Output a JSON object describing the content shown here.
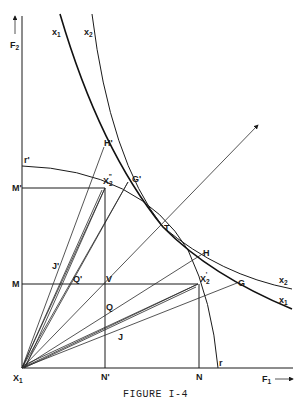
{
  "figure": {
    "caption": "FIGURE I-4",
    "axes": {
      "x_label": "F",
      "x_label_sub": "1",
      "y_label": "F",
      "y_label_sub": "2",
      "origin_label": "X",
      "origin_label_sub": "1"
    },
    "curves": {
      "isoquant_x1": {
        "label": "x",
        "sub": "1"
      },
      "isoquant_x2": {
        "label": "x",
        "sub": "2"
      },
      "arc_start": "r'",
      "arc_end": "r"
    },
    "points": {
      "H_prime": "H'",
      "G_prime": "G'",
      "X2_double_prime": {
        "label": "X",
        "sub": "2",
        "sup": "\""
      },
      "X2_prime": {
        "label": "X",
        "sub": "2",
        "sup": "'"
      },
      "T": "T",
      "H": "H",
      "G": "G",
      "M_prime": "M'",
      "M": "M",
      "J_prime": "J'",
      "Q_prime": "Q'",
      "V": "V",
      "Q": "Q",
      "J": "J",
      "N_prime": "N'",
      "N": "N"
    },
    "colors": {
      "ink": "#1a1a1a",
      "background": "#ffffff"
    }
  }
}
